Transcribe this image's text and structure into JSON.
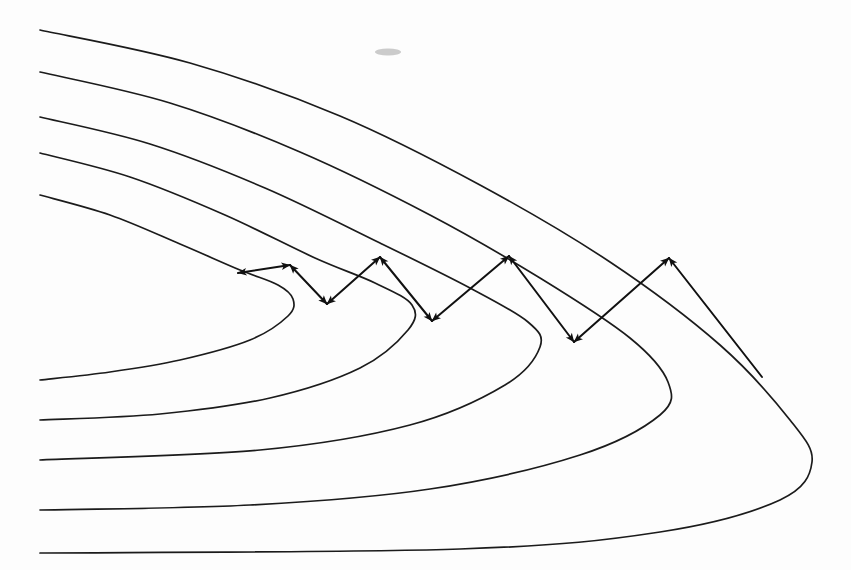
{
  "figure": {
    "title": "Nested confocal parabolas with reflecting zigzag ray path",
    "background_color": "#fdfdfd",
    "stroke_color": "#1b1b1b",
    "arrow_color": "#111111",
    "width": 851,
    "height": 570
  },
  "chart_data": {
    "type": "line",
    "title": "Nested confocal parabolas with reflecting zigzag ray path",
    "xlabel": "",
    "ylabel": "",
    "xlim": [
      0,
      851
    ],
    "ylim": [
      0,
      570
    ],
    "grid": false,
    "legend": "none",
    "coordinate_note": "Pixel coordinates, origin at top-left of the 851x570 image.",
    "series": [
      {
        "name": "parabola-1-innermost",
        "kind": "open-left-parabola",
        "vertex": [
          293,
          288
        ],
        "upper_endpoint": [
          40,
          195
        ],
        "lower_endpoint": [
          40,
          380
        ],
        "points": [
          [
            40,
            195
          ],
          [
            110,
            215
          ],
          [
            180,
            244
          ],
          [
            240,
            270
          ],
          [
            278,
            285
          ],
          [
            293,
            299
          ],
          [
            288,
            316
          ],
          [
            250,
            340
          ],
          [
            180,
            360
          ],
          [
            110,
            372
          ],
          [
            40,
            380
          ]
        ]
      },
      {
        "name": "parabola-2",
        "kind": "open-left-parabola",
        "vertex": [
          415,
          290
        ],
        "upper_endpoint": [
          40,
          153
        ],
        "lower_endpoint": [
          40,
          420
        ],
        "points": [
          [
            40,
            153
          ],
          [
            130,
            177
          ],
          [
            225,
            215
          ],
          [
            315,
            258
          ],
          [
            375,
            283
          ],
          [
            412,
            305
          ],
          [
            408,
            330
          ],
          [
            360,
            368
          ],
          [
            270,
            398
          ],
          [
            160,
            414
          ],
          [
            40,
            420
          ]
        ]
      },
      {
        "name": "parabola-3",
        "kind": "open-left-parabola",
        "vertex": [
          545,
          292
        ],
        "upper_endpoint": [
          40,
          117
        ],
        "lower_endpoint": [
          40,
          460
        ],
        "points": [
          [
            40,
            117
          ],
          [
            150,
            144
          ],
          [
            265,
            188
          ],
          [
            380,
            243
          ],
          [
            470,
            288
          ],
          [
            528,
            322
          ],
          [
            540,
            347
          ],
          [
            505,
            385
          ],
          [
            410,
            425
          ],
          [
            260,
            450
          ],
          [
            40,
            460
          ]
        ]
      },
      {
        "name": "parabola-4",
        "kind": "open-left-parabola",
        "vertex": [
          678,
          295
        ],
        "upper_endpoint": [
          40,
          72
        ],
        "lower_endpoint": [
          40,
          510
        ],
        "points": [
          [
            40,
            72
          ],
          [
            170,
            103
          ],
          [
            300,
            152
          ],
          [
            430,
            215
          ],
          [
            540,
            278
          ],
          [
            630,
            338
          ],
          [
            668,
            382
          ],
          [
            660,
            415
          ],
          [
            580,
            455
          ],
          [
            430,
            489
          ],
          [
            250,
            505
          ],
          [
            40,
            510
          ]
        ]
      },
      {
        "name": "parabola-5-outermost",
        "kind": "open-left-parabola",
        "vertex": [
          812,
          300
        ],
        "upper_endpoint": [
          40,
          30
        ],
        "lower_endpoint": [
          40,
          553
        ],
        "points": [
          [
            40,
            30
          ],
          [
            190,
            63
          ],
          [
            340,
            116
          ],
          [
            480,
            185
          ],
          [
            610,
            262
          ],
          [
            720,
            345
          ],
          [
            790,
            420
          ],
          [
            812,
            462
          ],
          [
            780,
            500
          ],
          [
            660,
            532
          ],
          [
            460,
            549
          ],
          [
            40,
            553
          ]
        ]
      }
    ],
    "annotations": [
      {
        "name": "zigzag-ray-path",
        "kind": "polyline-double-arrow",
        "arrowheads": "both-ends-of-each-segment",
        "vertices": [
          [
            238,
            273
          ],
          [
            290,
            265
          ],
          [
            327,
            304
          ],
          [
            380,
            257
          ],
          [
            432,
            321
          ],
          [
            509,
            256
          ],
          [
            574,
            342
          ],
          [
            669,
            258
          ],
          [
            762,
            377
          ]
        ],
        "segments": [
          {
            "from": [
              238,
              273
            ],
            "to": [
              290,
              265
            ],
            "label": "segment-1"
          },
          {
            "from": [
              290,
              265
            ],
            "to": [
              327,
              304
            ],
            "label": "segment-2"
          },
          {
            "from": [
              327,
              304
            ],
            "to": [
              380,
              257
            ],
            "label": "segment-3"
          },
          {
            "from": [
              380,
              257
            ],
            "to": [
              432,
              321
            ],
            "label": "segment-4"
          },
          {
            "from": [
              432,
              321
            ],
            "to": [
              509,
              256
            ],
            "label": "segment-5"
          },
          {
            "from": [
              509,
              256
            ],
            "to": [
              574,
              342
            ],
            "label": "segment-6"
          },
          {
            "from": [
              574,
              342
            ],
            "to": [
              669,
              258
            ],
            "label": "segment-7"
          },
          {
            "from": [
              669,
              258
            ],
            "to": [
              762,
              377
            ],
            "label": "segment-8"
          }
        ]
      },
      {
        "name": "ink-smudge",
        "kind": "artifact",
        "position": [
          388,
          52
        ],
        "size": [
          26,
          7
        ]
      }
    ]
  }
}
